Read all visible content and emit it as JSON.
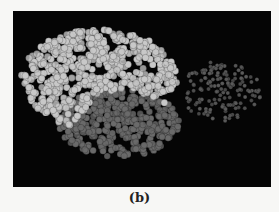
{
  "figure": {
    "caption": "(b)",
    "panel_color": "#050505",
    "clusters": [
      {
        "name": "light-domain",
        "color": "#c8c8c8",
        "seed": 7,
        "count": 520,
        "r": 3.4,
        "shape": "arch",
        "cx": 86,
        "cy": 68,
        "rx": 78,
        "ry": 50
      },
      {
        "name": "dark-domain",
        "color": "#6a6a6a",
        "seed": 13,
        "count": 360,
        "r": 3.2,
        "shape": "blob",
        "cx": 106,
        "cy": 112,
        "rx": 60,
        "ry": 34
      },
      {
        "name": "sparse-domain",
        "color": "#5a5a5a",
        "seed": 21,
        "count": 150,
        "r": 2.0,
        "shape": "blob",
        "cx": 208,
        "cy": 80,
        "rx": 40,
        "ry": 30
      }
    ]
  }
}
